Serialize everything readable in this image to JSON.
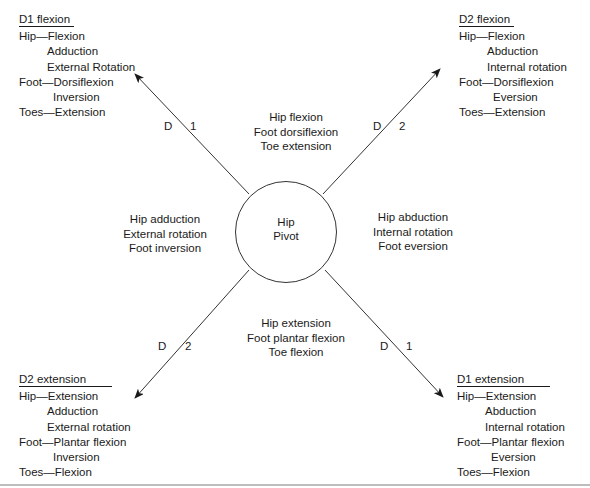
{
  "diagram": {
    "hub": {
      "line1": "Hip",
      "line2": "Pivot"
    },
    "patterns": {
      "d1_flexion": {
        "title": "D1 flexion",
        "lines": [
          "Hip—Flexion",
          "Adduction",
          "External Rotation",
          "Foot—Dorsiflexion",
          "Inversion",
          "Toes—Extension"
        ]
      },
      "d2_flexion": {
        "title": "D2 flexion",
        "lines": [
          "Hip—Flexion",
          "Abduction",
          "Internal rotation",
          "Foot—Dorsiflexion",
          "Eversion",
          "Toes—Extension"
        ]
      },
      "d2_extension": {
        "title": "D2 extension",
        "lines": [
          "Hip—Extension",
          "Adduction",
          "External rotation",
          "Foot—Plantar flexion",
          "Inversion",
          "Toes—Flexion"
        ]
      },
      "d1_extension": {
        "title": "D1 extension",
        "lines": [
          "Hip—Extension",
          "Abduction",
          "Internal rotation",
          "Foot—Plantar flexion",
          "Eversion",
          "Toes—Flexion"
        ]
      }
    },
    "quadrants": {
      "top": [
        "Hip flexion",
        "Foot dorsiflexion",
        "Toe extension"
      ],
      "left": [
        "Hip adduction",
        "External rotation",
        "Foot inversion"
      ],
      "right": [
        "Hip abduction",
        "Internal rotation",
        "Foot eversion"
      ],
      "bottom": [
        "Hip extension",
        "Foot plantar flexion",
        "Toe flexion"
      ]
    },
    "diagonal_labels": {
      "upper_left": {
        "d": "D",
        "n": "1"
      },
      "upper_right": {
        "d": "D",
        "n": "2"
      },
      "lower_left": {
        "d": "D",
        "n": "2"
      },
      "lower_right": {
        "d": "D",
        "n": "1"
      }
    }
  }
}
